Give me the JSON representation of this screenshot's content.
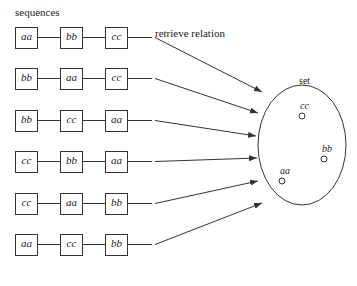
{
  "title": "sequences",
  "arrow_label": "retrieve relation",
  "set_label": "set",
  "sequences": [
    [
      "aa",
      "bb",
      "cc"
    ],
    [
      "bb",
      "aa",
      "cc"
    ],
    [
      "bb",
      "cc",
      "aa"
    ],
    [
      "cc",
      "bb",
      "aa"
    ],
    [
      "cc",
      "aa",
      "bb"
    ],
    [
      "aa",
      "cc",
      "bb"
    ]
  ],
  "set_elements": [
    {
      "label": "cc",
      "x": 302,
      "y": 116
    },
    {
      "label": "bb",
      "x": 324,
      "y": 159
    },
    {
      "label": "aa",
      "x": 282,
      "y": 181
    }
  ],
  "colors": {
    "stroke": "#333333",
    "text": "#222222",
    "background": "#ffffff"
  }
}
